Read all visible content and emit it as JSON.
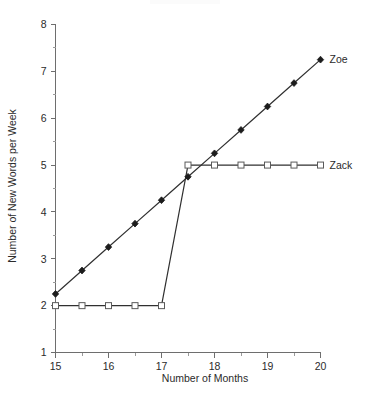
{
  "chart_data": {
    "type": "line",
    "title": "",
    "xlabel": "Number of Months",
    "ylabel": "Number of New Words per Week",
    "xlim": [
      15,
      20
    ],
    "ylim": [
      1,
      8
    ],
    "x_ticks_major": [
      15,
      16,
      17,
      18,
      19,
      20
    ],
    "x_tick_labels": [
      "15",
      "16",
      "17",
      "18",
      "19",
      "20"
    ],
    "x_ticks_minor": [
      15.5,
      16.5,
      17.5,
      18.5,
      19.5
    ],
    "y_ticks_major": [
      1,
      2,
      3,
      4,
      5,
      6,
      7,
      8
    ],
    "y_tick_labels": [
      "1",
      "2",
      "3",
      "4",
      "5",
      "6",
      "7",
      "8"
    ],
    "y_ticks_minor": [
      1.5,
      2.5,
      3.5,
      4.5,
      5.5,
      6.5,
      7.5
    ],
    "grid": false,
    "legend_position": "right-of-line-end",
    "series": [
      {
        "name": "Zoe",
        "marker": "filled-diamond",
        "color": "#1c1c1c",
        "x": [
          15,
          15.5,
          16,
          16.5,
          17,
          17.5,
          18,
          18.5,
          19,
          19.5,
          20
        ],
        "values": [
          2.25,
          2.75,
          3.25,
          3.75,
          4.25,
          4.75,
          5.25,
          5.75,
          6.25,
          6.75,
          7.25
        ]
      },
      {
        "name": "Zack",
        "marker": "open-square",
        "color": "#5a5a5a",
        "x": [
          15,
          15.5,
          16,
          16.5,
          17,
          17.5,
          18,
          18.5,
          19,
          19.5,
          20
        ],
        "values": [
          2,
          2,
          2,
          2,
          2,
          5,
          5,
          5,
          5,
          5,
          5
        ]
      }
    ]
  },
  "labels": {
    "zoe": "Zoe",
    "zack": "Zack"
  }
}
